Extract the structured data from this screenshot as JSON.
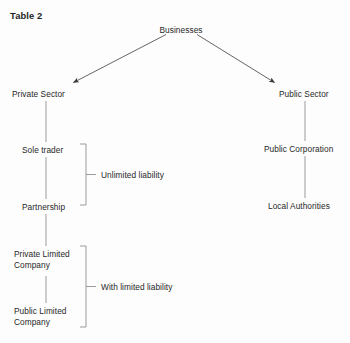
{
  "title": "Table 2",
  "colors": {
    "background": "#fdfdfd",
    "text": "#272727",
    "title_text": "#1d1d1d",
    "line": "#7c7c7c",
    "arrow": "#3a3a3a"
  },
  "diagram": {
    "type": "tree",
    "root": {
      "name": "businesses-node",
      "label": "Businesses"
    },
    "branches": [
      {
        "name": "private-sector-branch",
        "root_label": "Private Sector",
        "nodes": [
          {
            "name": "sole-trader-node",
            "label": "Sole trader"
          },
          {
            "name": "partnership-node",
            "label": "Partnership"
          },
          {
            "name": "private-limited-company-node",
            "label": "Private Limited\nCompany"
          },
          {
            "name": "public-limited-company-node",
            "label": "Public Limited\nCompany"
          }
        ],
        "brackets": [
          {
            "name": "unlimited-liability-bracket",
            "label": "Unlimited liability",
            "covers": [
              "Sole trader",
              "Partnership"
            ]
          },
          {
            "name": "with-limited-liability-bracket",
            "label": "With limited liability",
            "covers": [
              "Private Limited Company",
              "Public Limited Company"
            ]
          }
        ]
      },
      {
        "name": "public-sector-branch",
        "root_label": "Public Sector",
        "nodes": [
          {
            "name": "public-corporation-node",
            "label": "Public Corporation"
          },
          {
            "name": "local-authorities-node",
            "label": "Local Authorities"
          }
        ],
        "brackets": []
      }
    ]
  },
  "labels": {
    "businesses": "Businesses",
    "private_sector": "Private Sector",
    "public_sector": "Public Sector",
    "sole_trader": "Sole trader",
    "partnership": "Partnership",
    "private_limited_company": "Private Limited\nCompany",
    "public_limited_company": "Public Limited\nCompany",
    "public_corporation": "Public Corporation",
    "local_authorities": "Local Authorities",
    "unlimited_liability": "Unlimited liability",
    "with_limited_liability": "With limited liability"
  }
}
